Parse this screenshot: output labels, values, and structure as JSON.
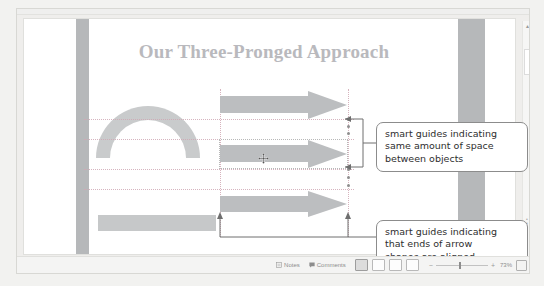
{
  "slide": {
    "title": "Our Three-Pronged Approach",
    "shapes": {
      "block_arc_name": "block-arc",
      "rectangle_name": "rectangle",
      "arrows": [
        {
          "label": "arrow-1"
        },
        {
          "label": "arrow-2"
        },
        {
          "label": "arrow-3"
        }
      ]
    }
  },
  "annotations": {
    "spacing_callout": "smart guides indicating same amount of space between objects",
    "spacing_callout_lines": [
      "smart guides indicating",
      "same amount of space",
      "between objects"
    ],
    "ends_callout": "smart guides indicating that ends of arrow shapes are aligned",
    "ends_callout_lines": [
      "smart guides indicating",
      "that ends of arrow",
      "shapes are aligned"
    ]
  },
  "status_bar": {
    "notes_label": "Notes",
    "comments_label": "Comments",
    "zoom_level": "73%",
    "zoom_out_sign": "−",
    "zoom_in_sign": "+",
    "view_buttons": [
      {
        "name": "normal-view",
        "active": true
      },
      {
        "name": "slide-sorter-view",
        "active": false
      },
      {
        "name": "reading-view",
        "active": false
      },
      {
        "name": "slide-show-view",
        "active": false
      }
    ]
  },
  "scrollbar": {
    "up_arrow": "▲",
    "down_arrow": "▼"
  },
  "colors": {
    "shape_fill": "#bcbec0",
    "design_bar": "#b6b8ba",
    "title_text": "#b9b9bd",
    "guide_line": "#cfa6b2",
    "callout_border": "#8c8c8c"
  }
}
